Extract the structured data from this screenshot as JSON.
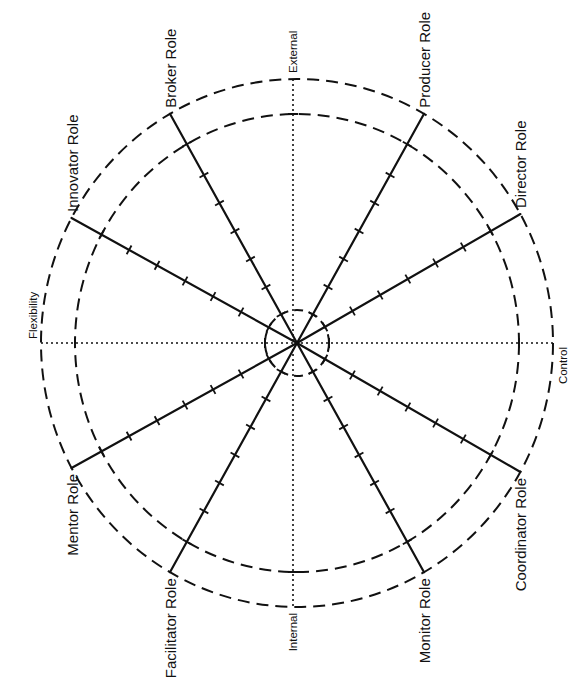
{
  "diagram": {
    "center": {
      "x": 297,
      "y": 343
    },
    "colors": {
      "stroke": "#111111",
      "background": "#ffffff"
    },
    "circles": {
      "outer": {
        "rx": 256,
        "ry": 264,
        "style": "dashed"
      },
      "middle": {
        "rx": 222,
        "ry": 229,
        "style": "dashed"
      },
      "inner": {
        "rx": 32,
        "ry": 33,
        "style": "dashed"
      }
    },
    "axes": [
      {
        "label": "External",
        "direction": "top"
      },
      {
        "label": "Internal",
        "direction": "bottom"
      },
      {
        "label": "Flexibility",
        "direction": "left"
      },
      {
        "label": "Control",
        "direction": "right"
      }
    ],
    "roles": [
      {
        "label": "Producer Role",
        "angle": 61
      },
      {
        "label": "Director Role",
        "angle": 30
      },
      {
        "label": "Coordinator Role",
        "angle": -30
      },
      {
        "label": "Monitor Role",
        "angle": -61
      },
      {
        "label": "Facilitator Role",
        "angle": -119
      },
      {
        "label": "Mentor Role",
        "angle": -151
      },
      {
        "label": "Innovator Role",
        "angle": 151
      },
      {
        "label": "Broker Role",
        "angle": 119
      }
    ],
    "ticks_per_spoke": 7,
    "tick_spacing": 32
  }
}
